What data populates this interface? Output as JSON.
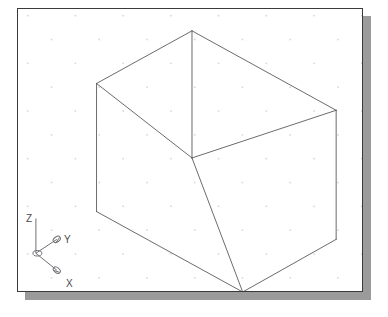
{
  "app": {
    "name": "CAD Model Space Viewport",
    "view_name": "SE Isometric",
    "visual_style": "2D Wireframe"
  },
  "canvas": {
    "width": 388,
    "height": 317,
    "background_color": "#ffffff",
    "border_color": "#3a3a3a",
    "shadow_color": "#9b9b9b",
    "window": {
      "x": 17,
      "y": 8,
      "width": 346,
      "height": 284
    },
    "shadow_offset": 8
  },
  "grid": {
    "visible": true,
    "style": "staggered-dots",
    "dot_color": "#d8d2d8",
    "dot_size": 1.5,
    "spacing_x": 48,
    "spacing_y": 24,
    "row_offset_x": 24,
    "origin_x": 9,
    "origin_y": 6
  },
  "model": {
    "object_name": "rectangular-box",
    "projection": "isometric",
    "edge_color": "#59595e",
    "edge_width": 0.9,
    "vertices": {
      "top_apex": {
        "x": 192,
        "y": 30,
        "label": "top-back-vertex"
      },
      "top_left": {
        "x": 96,
        "y": 83,
        "label": "top-left-vertex"
      },
      "top_right": {
        "x": 337,
        "y": 110,
        "label": "top-right-vertex"
      },
      "front_top": {
        "x": 192,
        "y": 158,
        "label": "front-center-vertex"
      },
      "bottom_left": {
        "x": 96,
        "y": 212,
        "label": "bottom-left-vertex"
      },
      "bottom_right": {
        "x": 337,
        "y": 240,
        "label": "bottom-right-vertex"
      },
      "bottom_front": {
        "x": 243,
        "y": 293,
        "label": "bottom-front-vertex"
      }
    },
    "edges": [
      {
        "name": "top-face-back-left",
        "from": "top_left",
        "to": "top_apex"
      },
      {
        "name": "top-face-back-right",
        "from": "top_apex",
        "to": "top_right"
      },
      {
        "name": "top-face-front-left",
        "from": "top_left",
        "to": "front_top"
      },
      {
        "name": "top-face-front-right",
        "from": "front_top",
        "to": "top_right"
      },
      {
        "name": "vertical-center-edge",
        "from": "top_apex",
        "to": "front_top"
      },
      {
        "name": "vertical-left-edge",
        "from": "top_left",
        "to": "bottom_left"
      },
      {
        "name": "vertical-right-edge",
        "from": "top_right",
        "to": "bottom_right"
      },
      {
        "name": "vertical-front-edge",
        "from": "front_top",
        "to": "bottom_front"
      },
      {
        "name": "bottom-front-left",
        "from": "bottom_left",
        "to": "bottom_front"
      },
      {
        "name": "bottom-front-right",
        "from": "bottom_front",
        "to": "bottom_right"
      }
    ]
  },
  "ucs_icon": {
    "name": "ucs-axis-icon",
    "origin": {
      "x": 35,
      "y": 254
    },
    "line_color": "#6f6f74",
    "label_color": "#4a4a4a",
    "axes": [
      {
        "key": "z",
        "label": "Z",
        "label_x": 25,
        "label_y": 213,
        "tip_x": 35,
        "tip_y": 219,
        "has_arrow": false
      },
      {
        "key": "y",
        "label": "Y",
        "label_x": 63,
        "label_y": 234,
        "tip_x": 56,
        "tip_y": 240,
        "has_arrow": true
      },
      {
        "key": "x",
        "label": "X",
        "label_x": 65,
        "label_y": 278,
        "tip_x": 56,
        "tip_y": 271,
        "has_arrow": true
      }
    ]
  }
}
